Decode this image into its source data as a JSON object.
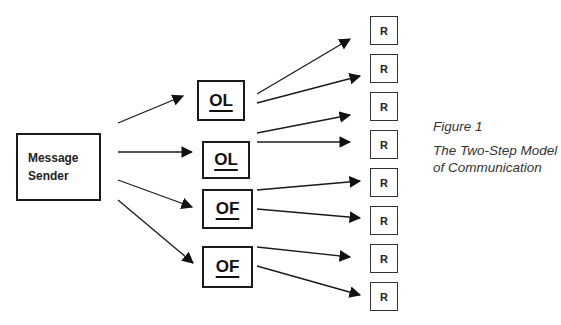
{
  "diagram": {
    "type": "flow",
    "title": "The Two-Step Model of Communication",
    "figure_label": "Figure 1",
    "sender": {
      "line1": "Message",
      "line2": "Sender"
    },
    "opinion_nodes": [
      {
        "label": "OL"
      },
      {
        "label": "OL"
      },
      {
        "label": "OF"
      },
      {
        "label": "OF"
      }
    ],
    "receivers": [
      {
        "label": "R"
      },
      {
        "label": "R"
      },
      {
        "label": "R"
      },
      {
        "label": "R"
      },
      {
        "label": "R"
      },
      {
        "label": "R"
      },
      {
        "label": "R"
      },
      {
        "label": "R"
      }
    ],
    "edges": [
      {
        "from": "Message Sender",
        "to": "OL (1)"
      },
      {
        "from": "Message Sender",
        "to": "OL (2)"
      },
      {
        "from": "Message Sender",
        "to": "OF (1)"
      },
      {
        "from": "Message Sender",
        "to": "OF (2)"
      },
      {
        "from": "OL (1)",
        "to": "R (1)"
      },
      {
        "from": "OL (1)",
        "to": "R (2)"
      },
      {
        "from": "OL (2)",
        "to": "R (3)"
      },
      {
        "from": "OL (2)",
        "to": "R (4)"
      },
      {
        "from": "OF (1)",
        "to": "R (5)"
      },
      {
        "from": "OF (1)",
        "to": "R (6)"
      },
      {
        "from": "OF (2)",
        "to": "R (7)"
      },
      {
        "from": "OF (2)",
        "to": "R (8)"
      }
    ]
  },
  "caption": {
    "figure": "Figure 1",
    "title_line1": "The Two-Step Model",
    "title_line2": "of Communication"
  },
  "colors": {
    "stroke": "#1a1a1a",
    "background": "#ffffff",
    "caption_text": "#333333"
  }
}
